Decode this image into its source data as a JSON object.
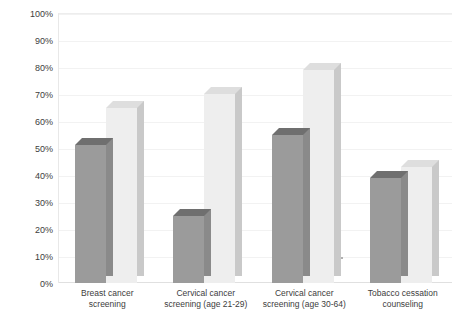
{
  "chart_data": {
    "type": "bar",
    "title": "",
    "subtitle": "",
    "xlabel": "",
    "ylabel": "",
    "ylim": [
      0,
      100
    ],
    "ytick_labels": [
      "100%",
      "90%",
      "80%",
      "70%",
      "60%",
      "50%",
      "40%",
      "30%",
      "20%",
      "10%",
      "0%"
    ],
    "ytick_values": [
      100,
      90,
      80,
      70,
      60,
      50,
      40,
      30,
      20,
      10,
      0
    ],
    "grid": true,
    "legend": "none",
    "style": "3d-grouped-column",
    "categories": [
      "Breast cancer screening",
      "Cervical cancer screening (age 21-29)",
      "Cervical cancer screening (age 30-64)",
      "Tobacco cessation counseling"
    ],
    "category_lines": [
      [
        "Breast cancer",
        "screening"
      ],
      [
        "Cervical cancer",
        "screening (age 21-29)"
      ],
      [
        "Cervical cancer",
        "screening (age 30-64)"
      ],
      [
        "Tobacco cessation",
        "counseling"
      ]
    ],
    "series": [
      {
        "name": "series-1",
        "color": "#9b9b9b",
        "values": [
          51,
          25,
          55,
          39
        ]
      },
      {
        "name": "series-2",
        "color": "#eeeeee",
        "values": [
          65,
          70,
          79,
          43
        ]
      }
    ]
  }
}
